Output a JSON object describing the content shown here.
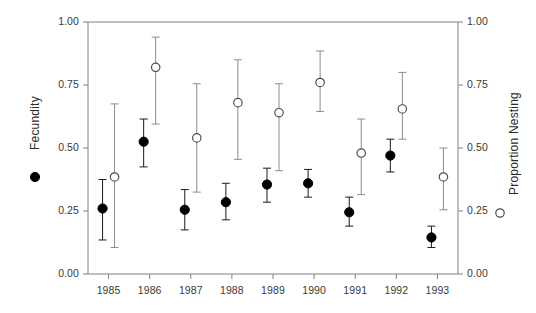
{
  "chart_data": {
    "type": "scatter",
    "title": "",
    "xlabel": "",
    "categories": [
      "1985",
      "1986",
      "1987",
      "1988",
      "1989",
      "1990",
      "1991",
      "1992",
      "1993"
    ],
    "x": [
      1985,
      1986,
      1987,
      1988,
      1989,
      1990,
      1991,
      1992,
      1993
    ],
    "grid": false,
    "legend_position": "outside-left-and-right",
    "left_axis": {
      "label": "Fecundity",
      "ylim": [
        0.0,
        1.0
      ],
      "ticks": [
        0.0,
        0.25,
        0.5,
        0.75,
        1.0
      ],
      "tick_labels": [
        "0.00",
        "0.25",
        "0.50",
        "0.75",
        "1.00"
      ]
    },
    "right_axis": {
      "label": "Proportion Nesting",
      "ylim": [
        0.0,
        1.0
      ],
      "ticks": [
        0.0,
        0.25,
        0.5,
        0.75,
        1.0
      ],
      "tick_labels": [
        "0.00",
        "0.25",
        "0.50",
        "0.75",
        "1.00"
      ]
    },
    "series": [
      {
        "name": "Fecundity",
        "marker": "filled-circle",
        "color": "#000000",
        "axis": "left",
        "values": [
          0.26,
          0.525,
          0.255,
          0.285,
          0.355,
          0.36,
          0.245,
          0.47,
          0.145
        ],
        "err_low": [
          0.135,
          0.425,
          0.175,
          0.215,
          0.285,
          0.305,
          0.19,
          0.405,
          0.105
        ],
        "err_high": [
          0.375,
          0.615,
          0.335,
          0.36,
          0.42,
          0.415,
          0.305,
          0.535,
          0.19
        ]
      },
      {
        "name": "Proportion Nesting",
        "marker": "open-circle",
        "color": "#000000",
        "axis": "right",
        "values": [
          0.385,
          0.82,
          0.54,
          0.68,
          0.64,
          0.76,
          0.48,
          0.655,
          0.385
        ],
        "err_low": [
          0.105,
          0.595,
          0.325,
          0.455,
          0.41,
          0.645,
          0.315,
          0.535,
          0.255
        ],
        "err_high": [
          0.675,
          0.94,
          0.755,
          0.85,
          0.755,
          0.885,
          0.615,
          0.8,
          0.5
        ]
      }
    ]
  },
  "legend": {
    "left_marker": "filled-circle",
    "left_label": "Fecundity",
    "right_marker": "open-circle",
    "right_label": "Proportion Nesting"
  },
  "colors": {
    "axis": "#808080",
    "marker_fill": "#000000",
    "marker_open_stroke": "#4d4d4d",
    "errorbar_filled": "#1a1a1a",
    "errorbar_open": "#8c8c8c",
    "text": "#2b2b2b"
  }
}
